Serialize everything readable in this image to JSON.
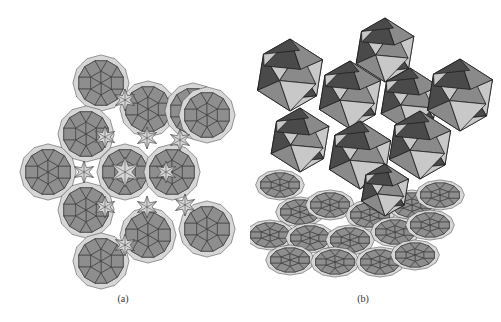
{
  "figure": {
    "panels": [
      {
        "id": "a",
        "label": "(a)",
        "description": "2D tiling of dodecagonal wheels of triangles and squares with light six-point star gaps"
      },
      {
        "id": "b",
        "label": "(b)",
        "description": "3D polyhedral (icosahedral) clusters rising above a perspective view of the same tiling"
      }
    ],
    "colors": {
      "dark_tile": "#8e8e8e",
      "light_tile": "#d6d6d6",
      "edge": "#3a3a3a",
      "poly_dark": "#4a4a4a",
      "poly_mid": "#8a8a8a",
      "poly_light": "#c8c8c8",
      "background": "#ffffff"
    },
    "tiling_a": {
      "center": [
        125,
        172
      ],
      "wheel_radius": 23,
      "wheels": [
        [
          101,
          83
        ],
        [
          148,
          109
        ],
        [
          193,
          111
        ],
        [
          207,
          115
        ],
        [
          86,
          134
        ],
        [
          48,
          172
        ],
        [
          125,
          172
        ],
        [
          172,
          172
        ],
        [
          86,
          210
        ],
        [
          148,
          235
        ],
        [
          207,
          229
        ],
        [
          101,
          261
        ]
      ]
    },
    "tiling_b": {
      "wheels": [
        [
          280,
          185
        ],
        [
          300,
          212
        ],
        [
          330,
          205
        ],
        [
          370,
          215
        ],
        [
          412,
          205
        ],
        [
          440,
          195
        ],
        [
          270,
          235
        ],
        [
          310,
          238
        ],
        [
          350,
          240
        ],
        [
          395,
          232
        ],
        [
          430,
          225
        ],
        [
          290,
          260
        ],
        [
          335,
          262
        ],
        [
          380,
          262
        ],
        [
          415,
          255
        ]
      ],
      "polyhedra": [
        [
          290,
          75,
          36
        ],
        [
          385,
          50,
          32
        ],
        [
          350,
          95,
          34
        ],
        [
          410,
          100,
          32
        ],
        [
          460,
          95,
          36
        ],
        [
          300,
          140,
          32
        ],
        [
          360,
          155,
          34
        ],
        [
          420,
          145,
          34
        ],
        [
          385,
          190,
          26
        ]
      ]
    }
  }
}
